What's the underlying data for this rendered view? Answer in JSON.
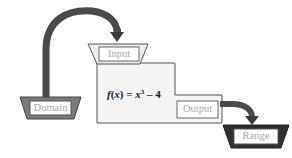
{
  "diagram": {
    "domain_label": "Domain",
    "input_label": "Input",
    "output_label": "Output",
    "range_label": "Range",
    "formula": {
      "fname": "f",
      "var": "x",
      "equals": " = ",
      "base": "x",
      "exponent": "3",
      "rest": " – 4",
      "full": "f(x) = x³ – 4"
    },
    "colors": {
      "domain_funnel": "#7a7a7a",
      "input_funnel": "#e6e6e6",
      "range_funnel": "#2e2e2e",
      "arrow": "#4a4a4a",
      "machine_body": "#f4f4f4",
      "outline": "#555555",
      "label_text": "#a8a8a8"
    }
  }
}
